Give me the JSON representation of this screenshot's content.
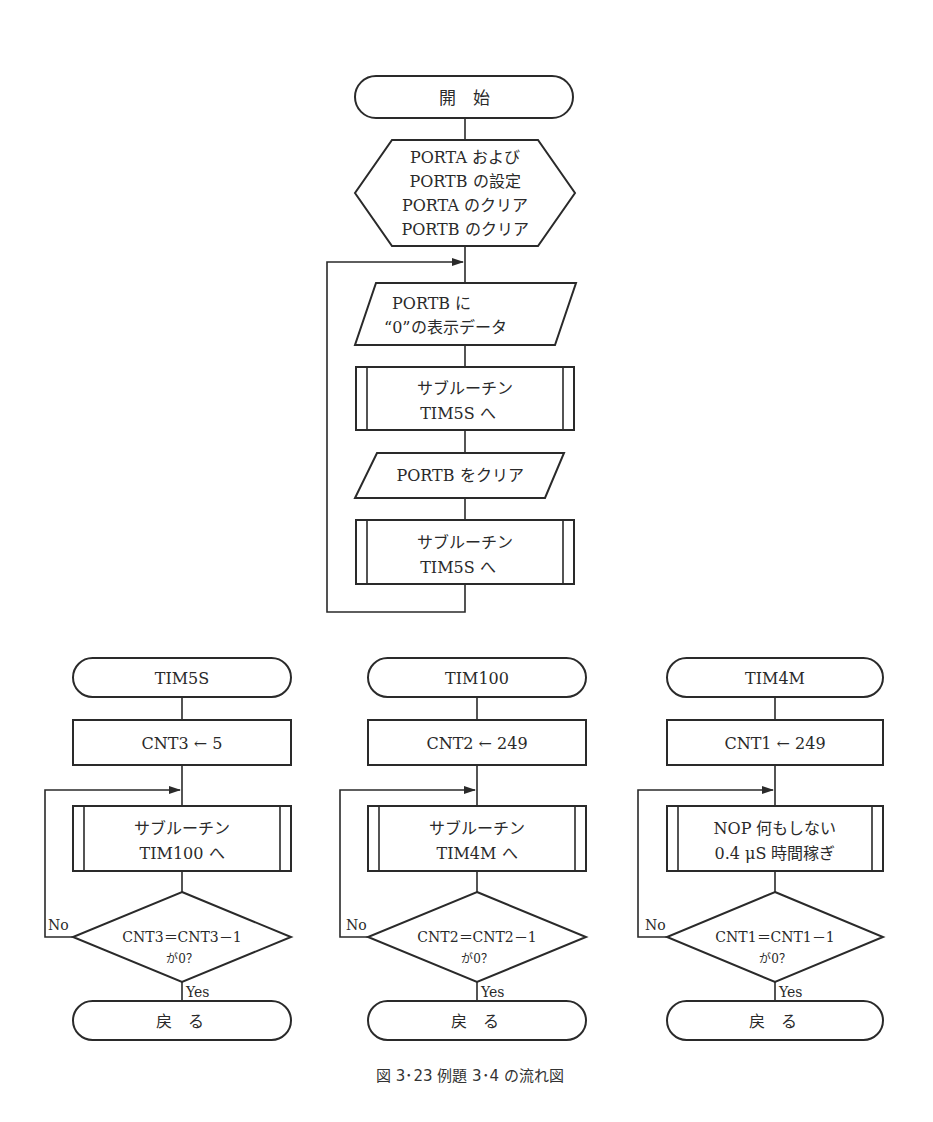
{
  "main_flow": {
    "start": "開　始",
    "setup": [
      "PORTA および",
      "PORTB の設定",
      "PORTA のクリア",
      "PORTB のクリア"
    ],
    "output1": [
      "PORTB に",
      "“0”の表示データ"
    ],
    "sub1": [
      "サブルーチン",
      "TIM5S へ"
    ],
    "output2": "PORTB をクリア",
    "sub2": [
      "サブルーチン",
      "TIM5S へ"
    ]
  },
  "tim5s": {
    "title": "TIM5S",
    "init": "CNT3 ← 5",
    "sub": [
      "サブルーチン",
      "TIM100 へ"
    ],
    "decision": [
      "CNT3＝CNT3－1",
      "が0？"
    ],
    "no": "No",
    "yes": "Yes",
    "end": "戻　る"
  },
  "tim100": {
    "title": "TIM100",
    "init": "CNT2 ← 249",
    "sub": [
      "サブルーチン",
      "TIM4M へ"
    ],
    "decision": [
      "CNT2＝CNT2－1",
      "が0？"
    ],
    "no": "No",
    "yes": "Yes",
    "end": "戻　る"
  },
  "tim4m": {
    "title": "TIM4M",
    "init": "CNT1 ← 249",
    "sub": [
      "NOP 何もしない",
      "0.4 μS 時間稼ぎ"
    ],
    "decision": [
      "CNT1＝CNT1－1",
      "が0？"
    ],
    "no": "No",
    "yes": "Yes",
    "end": "戻　る"
  },
  "caption": "図 3･23  例題 3･4 の流れ図"
}
